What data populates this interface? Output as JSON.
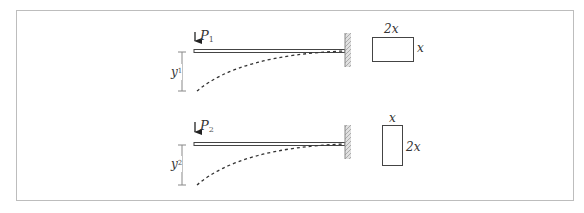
{
  "figure": {
    "colors": {
      "border": "#bdbdbd",
      "stroke": "#333333",
      "wall": "#9e9e9e",
      "text": "#333333"
    },
    "cases": [
      {
        "force_label": "P",
        "force_subscript": "1",
        "deflection_label": "y",
        "deflection_subscript": "1",
        "cross_section": {
          "width_label": "2x",
          "height_label": "x",
          "orientation": "landscape"
        }
      },
      {
        "force_label": "P",
        "force_subscript": "2",
        "deflection_label": "y",
        "deflection_subscript": "2",
        "cross_section": {
          "width_label": "x",
          "height_label": "2x",
          "orientation": "portrait"
        }
      }
    ]
  }
}
